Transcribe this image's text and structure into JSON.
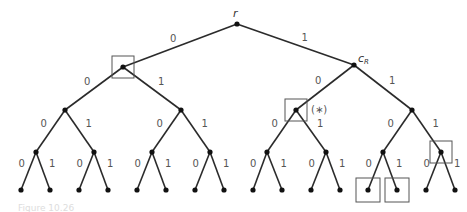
{
  "diagram": {
    "type": "binary-tree",
    "depth": 4,
    "root_label": "r",
    "right_child_label": "c",
    "right_child_subscript": "R",
    "marker_label": "(∗)",
    "caption_partial": "Figure 10.26",
    "edge_labels": {
      "left": "0",
      "right": "1"
    },
    "colors": {
      "edge": "#2b2b2b",
      "node": "#111111",
      "box": "#555555",
      "label": "#555555"
    },
    "nodes": [
      {
        "id": "r",
        "x": 237,
        "y": 24
      },
      {
        "id": "0",
        "x": 123,
        "y": 67
      },
      {
        "id": "1",
        "x": 354,
        "y": 65
      },
      {
        "id": "00",
        "x": 65,
        "y": 110
      },
      {
        "id": "01",
        "x": 181,
        "y": 110
      },
      {
        "id": "10",
        "x": 296,
        "y": 110
      },
      {
        "id": "11",
        "x": 412,
        "y": 110
      },
      {
        "id": "000",
        "x": 36,
        "y": 152
      },
      {
        "id": "001",
        "x": 94,
        "y": 152
      },
      {
        "id": "010",
        "x": 152,
        "y": 152
      },
      {
        "id": "011",
        "x": 210,
        "y": 152
      },
      {
        "id": "100",
        "x": 267,
        "y": 152
      },
      {
        "id": "101",
        "x": 326,
        "y": 152
      },
      {
        "id": "110",
        "x": 383,
        "y": 152
      },
      {
        "id": "111",
        "x": 441,
        "y": 152
      },
      {
        "id": "0000",
        "x": 21,
        "y": 190
      },
      {
        "id": "0001",
        "x": 50,
        "y": 190
      },
      {
        "id": "0010",
        "x": 79,
        "y": 190
      },
      {
        "id": "0011",
        "x": 108,
        "y": 190
      },
      {
        "id": "0100",
        "x": 137,
        "y": 190
      },
      {
        "id": "0101",
        "x": 166,
        "y": 190
      },
      {
        "id": "0110",
        "x": 195,
        "y": 190
      },
      {
        "id": "0111",
        "x": 224,
        "y": 190
      },
      {
        "id": "1000",
        "x": 253,
        "y": 190
      },
      {
        "id": "1001",
        "x": 282,
        "y": 190
      },
      {
        "id": "1010",
        "x": 311,
        "y": 190
      },
      {
        "id": "1011",
        "x": 340,
        "y": 190
      },
      {
        "id": "1100",
        "x": 368,
        "y": 190
      },
      {
        "id": "1101",
        "x": 397,
        "y": 190
      },
      {
        "id": "1110",
        "x": 426,
        "y": 190
      },
      {
        "id": "1111",
        "x": 455,
        "y": 190
      }
    ],
    "boxed_nodes": [
      "0",
      "10",
      "111",
      "1100",
      "1101"
    ],
    "starred_node": "10"
  }
}
